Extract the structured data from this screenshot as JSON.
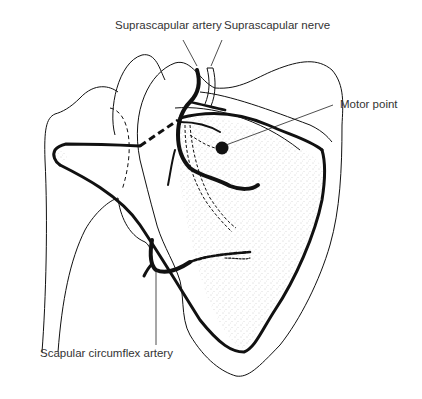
{
  "figure": {
    "colors": {
      "ink": "#111111",
      "label_text": "#333333",
      "stipple": "#9a9a9a",
      "background": "#ffffff"
    }
  },
  "labels": {
    "suprascapular_artery": "Suprascapular artery",
    "suprascapular_nerve": "Suprascapular nerve",
    "motor_point": "Motor point",
    "scapular_circumflex_artery": "Scapular circumflex artery"
  }
}
